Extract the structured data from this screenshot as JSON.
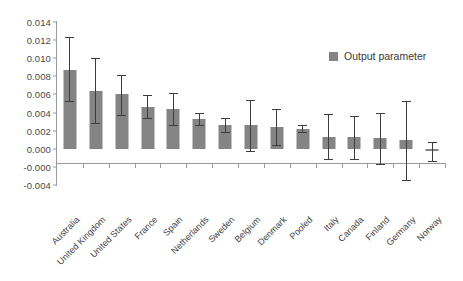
{
  "chart_data": {
    "type": "bar",
    "title": "",
    "xlabel": "",
    "ylabel": "",
    "ylim": [
      -0.004,
      0.014
    ],
    "grid": false,
    "legend_position": "top-right",
    "ytick_labels": [
      "0.014",
      "0.012",
      "0.010",
      "0.008",
      "0.006",
      "0.004",
      "0.002",
      "0.000",
      "-0.000",
      "-0.004"
    ],
    "ytick_values": [
      0.014,
      0.012,
      0.01,
      0.008,
      0.006,
      0.004,
      0.002,
      0.0,
      -0.002,
      -0.004
    ],
    "legend": [
      {
        "name": "Output parameter",
        "color": "#848484"
      }
    ],
    "categories": [
      "Australia",
      "United Kingdom",
      "United States",
      "France",
      "Spain",
      "Netherlands",
      "Sweden",
      "Belgium",
      "Denmark",
      "Pooled",
      "Italy",
      "Canada",
      "Finland",
      "Germany",
      "Norway"
    ],
    "series": [
      {
        "name": "Output parameter",
        "color": "#848484",
        "values": [
          0.0087,
          0.0064,
          0.006,
          0.0046,
          0.0044,
          0.0033,
          0.0026,
          0.0026,
          0.0024,
          0.0022,
          0.0013,
          0.0013,
          0.0012,
          0.001,
          -0.0003
        ],
        "error_low": [
          0.0053,
          0.0028,
          0.0037,
          0.0034,
          0.0026,
          0.0026,
          0.0019,
          -0.0002,
          0.0004,
          0.0019,
          -0.0011,
          -0.0011,
          -0.0017,
          -0.0034,
          -0.0013
        ],
        "error_high": [
          0.0123,
          0.01,
          0.0082,
          0.0059,
          0.0062,
          0.004,
          0.0034,
          0.0054,
          0.0044,
          0.0026,
          0.0038,
          0.0036,
          0.004,
          0.0053,
          0.0008
        ]
      }
    ]
  },
  "legend": {
    "series_label": "Output parameter"
  }
}
